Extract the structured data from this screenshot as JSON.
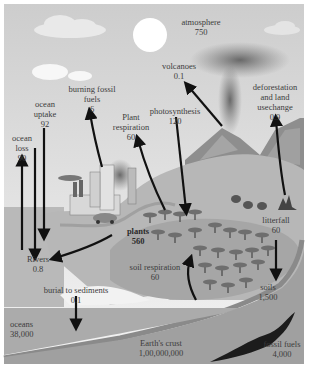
{
  "labels": {
    "atmosphere": {
      "name": "atmosphere",
      "value": "750"
    },
    "volcanoes": {
      "name": "volcanoes",
      "value": "0.1"
    },
    "deforestation": {
      "line1": "deforestation",
      "line2": "and land",
      "line3": "usechange",
      "value": "0.9"
    },
    "burning_fossil_fuels": {
      "line1": "burning fossil",
      "line2": "fuels",
      "value": "6"
    },
    "ocean_uptake": {
      "line1": "ocean",
      "line2": "uptake",
      "value": "92"
    },
    "ocean_loss": {
      "line1": "ocean",
      "line2": "loss",
      "value": "90"
    },
    "plant_respiration": {
      "line1": "Plant",
      "line2": "respiration",
      "value": "60"
    },
    "photosynthesis": {
      "name": "photosynthesis",
      "value": "120"
    },
    "plants": {
      "name": "plants",
      "value": "560"
    },
    "soil_respiration": {
      "name": "soil respiration",
      "value": "60"
    },
    "litterfall": {
      "name": "litterfall",
      "value": "60"
    },
    "rivers": {
      "name": "Rivers",
      "value": "0.8"
    },
    "burial": {
      "name": "burial to sediments",
      "value": "0.1"
    },
    "soils": {
      "name": "soils",
      "value": "1,500"
    },
    "oceans": {
      "name": "oceans",
      "value": "38,000"
    },
    "earths_crust": {
      "name": "Earth's crust",
      "value": "1,00,000,000"
    },
    "fossil_fuels": {
      "name": "fossil fuels",
      "value": "4,000"
    }
  },
  "colors": {
    "sky_top": "#cfcfcf",
    "sky_bottom": "#f2f2f2",
    "land": "#b5b5b5",
    "ocean": "#a9a9a9",
    "crust": "#9e9e9e",
    "arrow": "#111111",
    "fossil": "#1c1c1c"
  }
}
